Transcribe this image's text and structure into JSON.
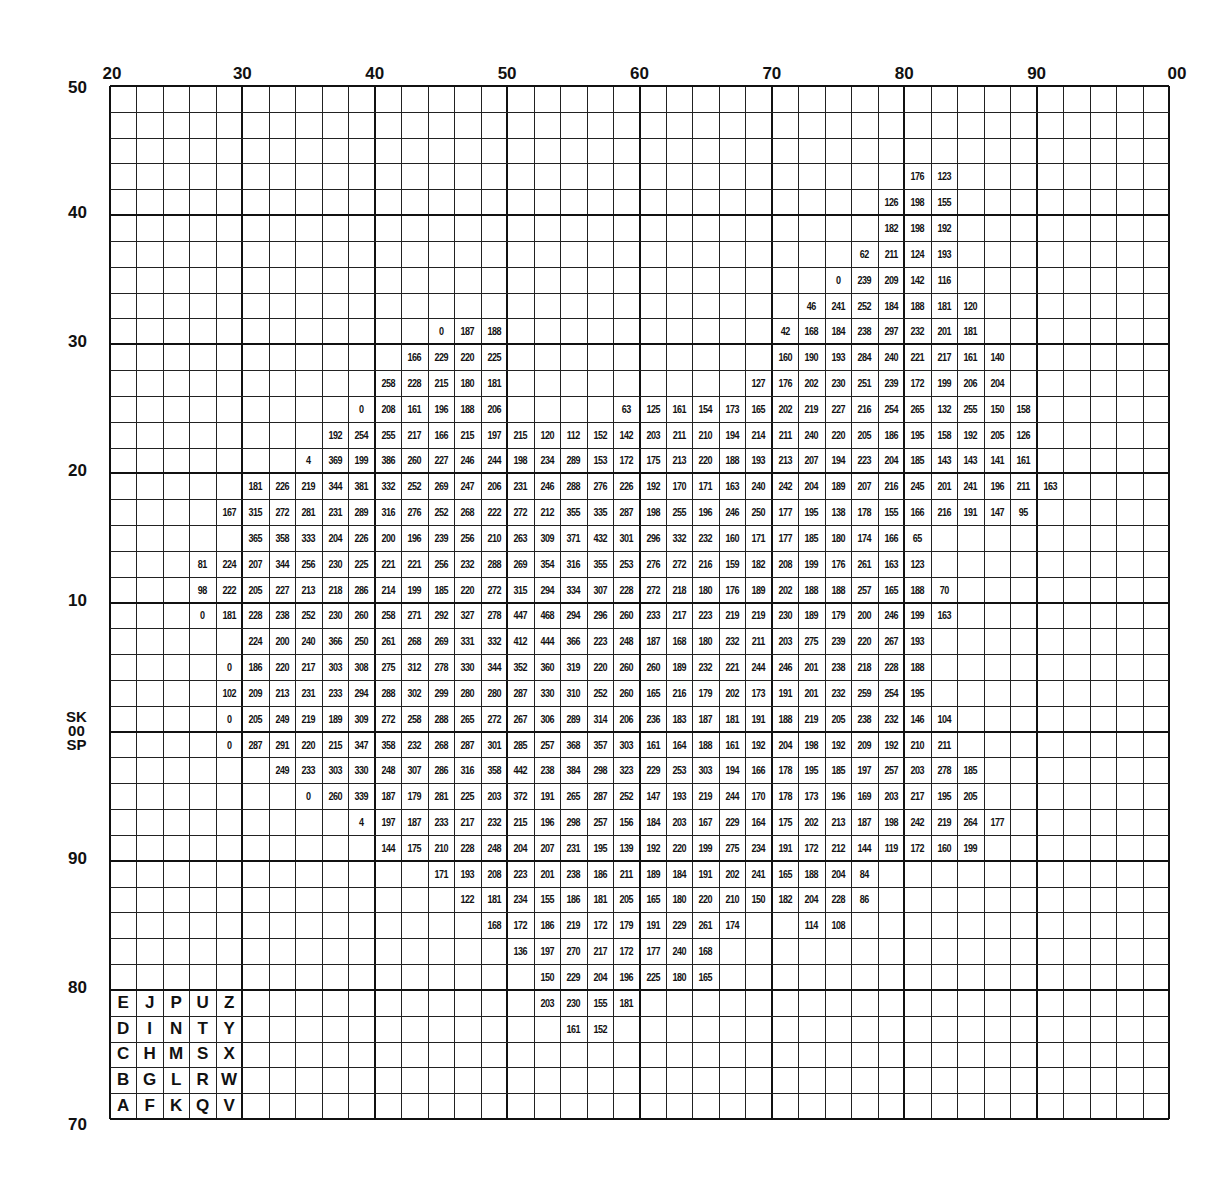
{
  "chart_data": {
    "type": "table",
    "title": "",
    "grid": {
      "cols": 40,
      "rows": 40,
      "easting_start": 20,
      "easting_end": 100,
      "northing_top": 50,
      "northing_bottom": 70
    },
    "x_tick_labels": [
      {
        "col": 0,
        "label": "20"
      },
      {
        "col": 5,
        "label": "30"
      },
      {
        "col": 10,
        "label": "40"
      },
      {
        "col": 15,
        "label": "50"
      },
      {
        "col": 20,
        "label": "60"
      },
      {
        "col": 25,
        "label": "70"
      },
      {
        "col": 30,
        "label": "80"
      },
      {
        "col": 35,
        "label": "90"
      },
      {
        "col": 40,
        "label": "00"
      }
    ],
    "y_tick_labels": [
      {
        "row": 0,
        "label": "50"
      },
      {
        "row": 5,
        "label": "40"
      },
      {
        "row": 10,
        "label": "30"
      },
      {
        "row": 15,
        "label": "20"
      },
      {
        "row": 20,
        "label": "10"
      },
      {
        "row": 30,
        "label": "90"
      },
      {
        "row": 35,
        "label": "80"
      },
      {
        "row": 40,
        "label": "70"
      }
    ],
    "square_labels": {
      "row": 25,
      "top": "SK",
      "middle": "00",
      "bottom": "SP"
    },
    "legend_letters": [
      [
        "E",
        "J",
        "P",
        "U",
        "Z"
      ],
      [
        "D",
        "I",
        "N",
        "T",
        "Y"
      ],
      [
        "C",
        "H",
        "M",
        "S",
        "X"
      ],
      [
        "B",
        "G",
        "L",
        "R",
        "W"
      ],
      [
        "A",
        "F",
        "K",
        "Q",
        "V"
      ]
    ],
    "rows": [
      {
        "r": 3,
        "start": 30,
        "values": [
          176,
          123
        ]
      },
      {
        "r": 4,
        "start": 29,
        "values": [
          126,
          198,
          155
        ]
      },
      {
        "r": 5,
        "start": 29,
        "values": [
          182,
          198,
          192
        ]
      },
      {
        "r": 6,
        "start": 28,
        "values": [
          62,
          211,
          124,
          193
        ]
      },
      {
        "r": 7,
        "start": 27,
        "values": [
          0,
          239,
          209,
          142,
          116
        ]
      },
      {
        "r": 8,
        "start": 26,
        "values": [
          46,
          241,
          252,
          184,
          188,
          181,
          120
        ]
      },
      {
        "r": 9,
        "start": 12,
        "values": [
          0,
          187,
          188
        ]
      },
      {
        "r": 9,
        "start": 25,
        "values": [
          42,
          168,
          184,
          238,
          297,
          232,
          201,
          181
        ]
      },
      {
        "r": 10,
        "start": 11,
        "values": [
          166,
          229,
          220,
          225
        ]
      },
      {
        "r": 10,
        "start": 25,
        "values": [
          160,
          190,
          193,
          284,
          240,
          221,
          217,
          161,
          140
        ]
      },
      {
        "r": 11,
        "start": 10,
        "values": [
          258,
          228,
          215,
          180,
          181
        ]
      },
      {
        "r": 11,
        "start": 24,
        "values": [
          127,
          176,
          202,
          230,
          251,
          239,
          172,
          199,
          206,
          204
        ]
      },
      {
        "r": 12,
        "start": 9,
        "values": [
          0,
          208,
          161,
          196,
          188,
          206
        ]
      },
      {
        "r": 12,
        "start": 19,
        "values": [
          63,
          125,
          161,
          154,
          173,
          165,
          202,
          219,
          227,
          216,
          254,
          265,
          132,
          255,
          150,
          158
        ]
      },
      {
        "r": 13,
        "start": 8,
        "values": [
          192,
          254,
          255,
          217,
          166,
          215,
          197,
          215,
          120,
          112,
          152,
          142,
          203,
          211,
          210,
          194,
          214,
          211,
          240,
          220,
          205,
          186,
          195,
          158,
          192,
          205,
          126
        ]
      },
      {
        "r": 14,
        "start": 7,
        "values": [
          4,
          369,
          199,
          386,
          260,
          227,
          246,
          244,
          198,
          234,
          289,
          153,
          172,
          175,
          213,
          220,
          188,
          193,
          213,
          207,
          194,
          223,
          204,
          185,
          143,
          143,
          141,
          161
        ]
      },
      {
        "r": 15,
        "start": 5,
        "values": [
          181,
          226,
          219,
          344,
          381,
          332,
          252,
          269,
          247,
          206,
          231,
          246,
          288,
          276,
          226,
          192,
          170,
          171,
          163,
          240,
          242,
          204,
          189,
          207,
          216,
          245,
          201,
          241,
          196,
          211,
          163
        ]
      },
      {
        "r": 16,
        "start": 4,
        "values": [
          167,
          315,
          272,
          281,
          231,
          289,
          316,
          276,
          252,
          268,
          222,
          272,
          212,
          355,
          335,
          287,
          198,
          255,
          196,
          246,
          250,
          177,
          195,
          138,
          178,
          155,
          166,
          216,
          191,
          147,
          95
        ]
      },
      {
        "r": 17,
        "start": 5,
        "values": [
          365,
          358,
          333,
          204,
          226,
          200,
          196,
          239,
          256,
          210,
          263,
          309,
          371,
          432,
          301,
          296,
          332,
          232,
          160,
          171,
          177,
          185,
          180,
          174,
          166,
          65
        ]
      },
      {
        "r": 18,
        "start": 3,
        "values": [
          81,
          224,
          207,
          344,
          256,
          230,
          225,
          221,
          221,
          256,
          232,
          288,
          269,
          354,
          316,
          355,
          253,
          276,
          272,
          216,
          159,
          182,
          208,
          199,
          176,
          261,
          163,
          123
        ]
      },
      {
        "r": 19,
        "start": 3,
        "values": [
          98,
          222,
          205,
          227,
          213,
          218,
          286,
          214,
          199,
          185,
          220,
          272,
          315,
          294,
          334,
          307,
          228,
          272,
          218,
          180,
          176,
          189,
          202,
          188,
          188,
          257,
          165,
          188,
          70
        ]
      },
      {
        "r": 20,
        "start": 3,
        "values": [
          0,
          181,
          228,
          238,
          252,
          230,
          260,
          258,
          271,
          292,
          327,
          278,
          447,
          468,
          294,
          296,
          260,
          233,
          217,
          223,
          219,
          219,
          230,
          189,
          179,
          200,
          246,
          199,
          163
        ]
      },
      {
        "r": 21,
        "start": 5,
        "values": [
          224,
          200,
          240,
          366,
          250,
          261,
          268,
          269,
          331,
          332,
          412,
          444,
          366,
          223,
          248,
          187,
          168,
          180,
          232,
          211,
          203,
          275,
          239,
          220,
          267,
          193
        ]
      },
      {
        "r": 22,
        "start": 4,
        "values": [
          0,
          186,
          220,
          217,
          303,
          308,
          275,
          312,
          278,
          330,
          344,
          352,
          360,
          319,
          220,
          260,
          260,
          189,
          232,
          221,
          244,
          246,
          201,
          238,
          218,
          228,
          188
        ]
      },
      {
        "r": 23,
        "start": 4,
        "values": [
          102,
          209,
          213,
          231,
          233,
          294,
          288,
          302,
          299,
          280,
          280,
          287,
          330,
          310,
          252,
          260,
          165,
          216,
          179,
          202,
          173,
          191,
          201,
          232,
          259,
          254,
          195
        ]
      },
      {
        "r": 24,
        "start": 4,
        "values": [
          0,
          205,
          249,
          219,
          189,
          309,
          272,
          258,
          288,
          265,
          272,
          267,
          306,
          289,
          314,
          206,
          236,
          183,
          187,
          181,
          191,
          188,
          219,
          205,
          238,
          232,
          146,
          104
        ]
      },
      {
        "r": 25,
        "start": 4,
        "values": [
          0,
          287,
          291,
          220,
          215,
          347,
          358,
          232,
          268,
          287,
          301,
          285,
          257,
          368,
          357,
          303,
          161,
          164,
          188,
          161,
          192,
          204,
          198,
          192,
          209,
          192,
          210,
          211
        ]
      },
      {
        "r": 26,
        "start": 6,
        "values": [
          249,
          233,
          303,
          330,
          248,
          307,
          286,
          316,
          358,
          442,
          238,
          384,
          298,
          323,
          229,
          253,
          303,
          194,
          166,
          178,
          195,
          185,
          197,
          257,
          203,
          278,
          185
        ]
      },
      {
        "r": 27,
        "start": 7,
        "values": [
          0,
          260,
          339,
          187,
          179,
          281,
          225,
          203,
          372,
          191,
          265,
          287,
          252,
          147,
          193,
          219,
          244,
          170,
          178,
          173,
          196,
          169,
          203,
          217,
          195,
          205
        ]
      },
      {
        "r": 28,
        "start": 9,
        "values": [
          4,
          197,
          187,
          233,
          217,
          232,
          215,
          196,
          298,
          257,
          156,
          184,
          203,
          167,
          229,
          164,
          175,
          202,
          213,
          187,
          198,
          242,
          219,
          264,
          177
        ]
      },
      {
        "r": 29,
        "start": 10,
        "values": [
          144,
          175,
          210,
          228,
          248,
          204,
          207,
          231,
          195,
          139,
          192,
          220,
          199,
          275,
          234,
          191,
          172,
          212,
          144,
          119,
          172,
          160,
          199
        ]
      },
      {
        "r": 30,
        "start": 12,
        "values": [
          171,
          193,
          208,
          223,
          201,
          238,
          186,
          211,
          189,
          184,
          191,
          202,
          241,
          165,
          188,
          204,
          84
        ]
      },
      {
        "r": 31,
        "start": 13,
        "values": [
          122,
          181,
          234,
          155,
          186,
          181,
          205,
          165,
          180,
          220,
          210,
          150,
          182,
          204,
          228,
          86
        ]
      },
      {
        "r": 32,
        "start": 14,
        "values": [
          168,
          172,
          186,
          219,
          172,
          179,
          191,
          229,
          261,
          174
        ]
      },
      {
        "r": 32,
        "start": 26,
        "values": [
          114,
          108
        ]
      },
      {
        "r": 33,
        "start": 15,
        "values": [
          136,
          197,
          270,
          217,
          172,
          177,
          240,
          168
        ]
      },
      {
        "r": 34,
        "start": 16,
        "values": [
          150,
          229,
          204,
          196,
          225,
          180,
          165
        ]
      },
      {
        "r": 35,
        "start": 16,
        "values": [
          203,
          230,
          155,
          181
        ]
      },
      {
        "r": 36,
        "start": 17,
        "values": [
          161,
          152
        ]
      }
    ]
  }
}
